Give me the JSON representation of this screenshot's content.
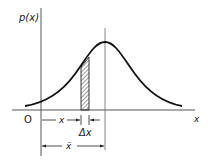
{
  "diagram": {
    "type": "probability-density-diagram",
    "y_axis_label": "p(x)",
    "x_axis_label": "x",
    "origin_label": "O",
    "curve": "bell-shaped density p(x) with peak at mean",
    "hatched_strip": {
      "description": "area element of width Δx at position x",
      "width_label": "Δx"
    },
    "dimension_labels": {
      "position": "x",
      "strip_width": "Δx",
      "mean": "x̄"
    },
    "colors": {
      "line": "#1a1a1a",
      "axis": "#555555",
      "background": "#ffffff"
    }
  }
}
